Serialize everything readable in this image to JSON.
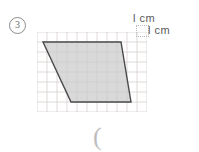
{
  "problem": {
    "number": "3",
    "number_style": "circled"
  },
  "legend": {
    "unit_label_top": "l cm",
    "unit_label_right": "l cm",
    "unit_square_name": "unit-square-1cm-by-1cm"
  },
  "answer": {
    "blank_text": "("
  },
  "colors": {
    "grid_line": "#d8cfcf",
    "shape_outline": "#4a4a4a",
    "shape_fill": "#cccccc",
    "text": "#5a5a5a",
    "background": "#ffffff"
  },
  "chart_data": {
    "type": "diagram",
    "title": "",
    "grid": {
      "visible": true,
      "cell_size_cm": 1,
      "columns": 11,
      "rows": 8,
      "cell_px": 10,
      "origin_px": [
        37,
        32
      ]
    },
    "shape": {
      "name": "parallelogram",
      "vertices_grid": [
        [
          0.6,
          1.0
        ],
        [
          8.4,
          1.0
        ],
        [
          9.4,
          7.0
        ],
        [
          3.4,
          7.0
        ]
      ],
      "top_edge_cm": 7.8,
      "bottom_edge_cm": 6.0,
      "height_cm": 6.0,
      "fill": "#cccccc",
      "stroke": "#4a4a4a",
      "stroke_width_px": 1.4
    }
  }
}
